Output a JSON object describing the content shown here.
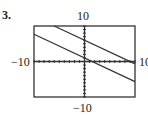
{
  "exercise": {
    "number": "3."
  },
  "window": {
    "xmin_label": "−10",
    "xmax_label": "10",
    "ymin_label": "−10",
    "ymax_label": "10"
  },
  "chart_data": {
    "type": "line",
    "title": "",
    "xlabel": "",
    "ylabel": "",
    "xlim": [
      -10,
      10
    ],
    "ylim": [
      -10,
      10
    ],
    "tick_spacing": 1,
    "grid": false,
    "legend": null,
    "tick_labels": {
      "x": [
        "-10",
        "10"
      ],
      "y": [
        "-10",
        "10"
      ]
    },
    "series": [
      {
        "name": "upper line",
        "equation_estimate": "y = -(2/3)x + 6",
        "x": [
          -6,
          10
        ],
        "y": [
          10,
          -0.67
        ]
      },
      {
        "name": "lower line",
        "equation_estimate": "y = -(2/3)x + 1",
        "x": [
          -10,
          10
        ],
        "y": [
          7.67,
          -5.67
        ]
      }
    ],
    "colors": {
      "axes": "#333333",
      "lines": "#333333",
      "frame": "#333333"
    }
  }
}
